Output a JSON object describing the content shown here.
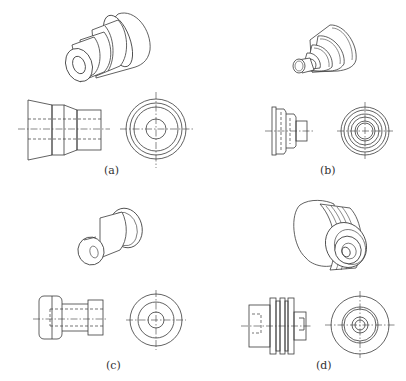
{
  "figure": {
    "colors": {
      "line": "#3a3a3a",
      "background": "#ffffff"
    },
    "panels": [
      {
        "id": "a",
        "caption": "(a)",
        "views": [
          "isometric",
          "front-view",
          "side-view"
        ],
        "description": "stepped tapered bushing with through bore"
      },
      {
        "id": "b",
        "caption": "(b)",
        "views": [
          "isometric",
          "front-view",
          "side-view"
        ],
        "description": "multi-step cone seal / grommet"
      },
      {
        "id": "c",
        "caption": "(c)",
        "views": [
          "isometric",
          "front-view",
          "side-view"
        ],
        "description": "spool-shaped flanged bushing with bore"
      },
      {
        "id": "d",
        "caption": "(d)",
        "views": [
          "isometric",
          "front-view",
          "side-view"
        ],
        "description": "grooved cylindrical plug with stepped nose"
      }
    ]
  }
}
